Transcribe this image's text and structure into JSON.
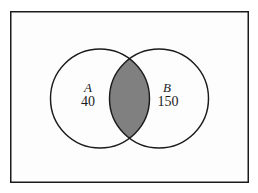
{
  "figure": {
    "name": "venn-diagram-two-sets",
    "background_color": "#fdfdfd",
    "page_background": "#ffffff",
    "border_color": "#1b1b1b",
    "stroke_color": "#1b1b1b",
    "intersection_fill": "#808080",
    "circle_fill": "#fdfdfd"
  },
  "universe": {
    "label": "",
    "rect": {
      "x": 10,
      "y": 11,
      "width": 239,
      "height": 172
    }
  },
  "sets": [
    {
      "id": "A",
      "label": "A",
      "count": "40",
      "label_x": 88,
      "label_y": 92,
      "count_x": 88,
      "count_y": 106,
      "circle": {
        "cx": 100,
        "cy": 98.5,
        "r": 49.5
      }
    },
    {
      "id": "B",
      "label": "B",
      "count": "150",
      "label_x": 167,
      "label_y": 92,
      "count_x": 168,
      "count_y": 106,
      "circle": {
        "cx": 159,
        "cy": 98.5,
        "r": 49.5
      }
    }
  ],
  "intersection": {
    "name": "intersection-region",
    "shaded": true,
    "fill": "#808080"
  },
  "chart_data": {
    "type": "venn",
    "title": "",
    "sets": [
      "A",
      "B"
    ],
    "labels": [
      "A",
      "B"
    ],
    "values": [
      40,
      150
    ],
    "intersection_shaded": true,
    "intersection_value": null
  }
}
